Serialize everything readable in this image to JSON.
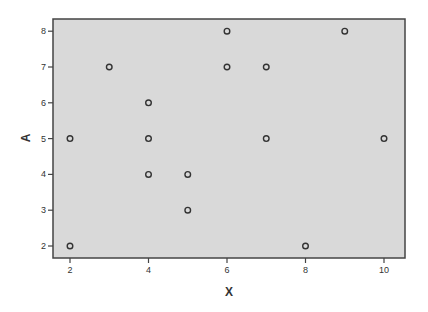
{
  "chart_data": {
    "type": "scatter",
    "title": "",
    "xlabel": "X",
    "ylabel": "A",
    "xlim": [
      1.6,
      10.4
    ],
    "ylim": [
      1.7,
      8.35
    ],
    "x_ticks": [
      2,
      4,
      6,
      8,
      10
    ],
    "y_ticks": [
      2,
      3,
      4,
      5,
      6,
      7,
      8
    ],
    "grid": false,
    "legend": null,
    "points": [
      {
        "x": 2,
        "y": 5
      },
      {
        "x": 2,
        "y": 2
      },
      {
        "x": 3,
        "y": 7
      },
      {
        "x": 4,
        "y": 6
      },
      {
        "x": 4,
        "y": 5
      },
      {
        "x": 4,
        "y": 4
      },
      {
        "x": 5,
        "y": 4
      },
      {
        "x": 5,
        "y": 3
      },
      {
        "x": 6,
        "y": 8
      },
      {
        "x": 6,
        "y": 7
      },
      {
        "x": 7,
        "y": 7
      },
      {
        "x": 7,
        "y": 5
      },
      {
        "x": 8,
        "y": 2
      },
      {
        "x": 9,
        "y": 8
      },
      {
        "x": 10,
        "y": 5
      }
    ],
    "colors": {
      "plot_background": "#d9d9d9",
      "frame": "#444444",
      "marker_stroke": "#333333"
    }
  }
}
